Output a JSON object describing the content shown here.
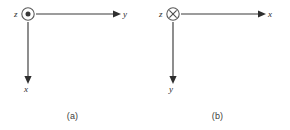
{
  "figure": {
    "background_color": "#ffffff",
    "line_color": "#3a3a3a",
    "text_color": "#2b2b2b",
    "width": 290,
    "height": 130
  },
  "panels": [
    {
      "id": "a",
      "caption": "(a)",
      "origin_symbol": "dot-in-circle",
      "origin_meaning": "axis pointing out of the page",
      "origin_axis_label": "z",
      "horizontal_axis_label": "y",
      "horizontal_axis_direction": "right",
      "vertical_axis_label": "x",
      "vertical_axis_direction": "down"
    },
    {
      "id": "b",
      "caption": "(b)",
      "origin_symbol": "cross-in-circle",
      "origin_meaning": "axis pointing into the page",
      "origin_axis_label": "z",
      "horizontal_axis_label": "x",
      "horizontal_axis_direction": "right",
      "vertical_axis_label": "y",
      "vertical_axis_direction": "down"
    }
  ]
}
